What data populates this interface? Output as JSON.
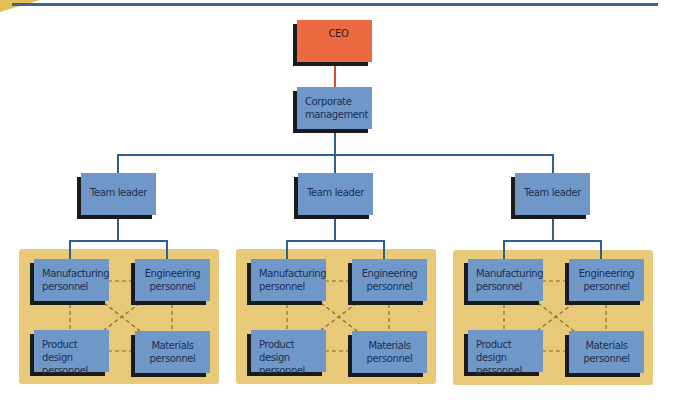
{
  "colors": {
    "ceo_fill": "#ec6a42",
    "box_fill": "#6f98c9",
    "panel_fill": "#e8c97a",
    "connector": "#2e5f8e",
    "ceo_connector": "#d4502c",
    "dashed": "#8a6a2a",
    "rule": "#3f6688"
  },
  "chart": {
    "ceo": {
      "label": "CEO"
    },
    "corporate": {
      "label": "Corporate management"
    },
    "teams": [
      {
        "leader": "Team leader",
        "members": {
          "manufacturing": "Manufacturing personnel",
          "engineering": "Engineering personnel",
          "product_design": "Product design personnel",
          "materials": "Materials personnel"
        }
      },
      {
        "leader": "Team leader",
        "members": {
          "manufacturing": "Manufacturing personnel",
          "engineering": "Engineering personnel",
          "product_design": "Product design personnel",
          "materials": "Materials personnel"
        }
      },
      {
        "leader": "Team leader",
        "members": {
          "manufacturing": "Manufacturing personnel",
          "engineering": "Engineering personnel",
          "product_design": "Product design personnel",
          "materials": "Materials personnel"
        }
      }
    ]
  }
}
